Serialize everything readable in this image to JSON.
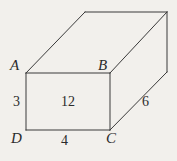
{
  "figure": {
    "type": "rectangular-prism-diagram",
    "background_color": "#f2f0ec",
    "line_color": "#3a3a3a",
    "text_color": "#2b2b2b",
    "vertices": {
      "A": {
        "label": "A",
        "x": 26,
        "y": 73
      },
      "B": {
        "label": "B",
        "x": 110,
        "y": 73
      },
      "C": {
        "label": "C",
        "x": 110,
        "y": 130
      },
      "D": {
        "label": "D",
        "x": 26,
        "y": 130
      },
      "back_top_left": {
        "x": 85,
        "y": 12
      },
      "back_top_right": {
        "x": 167,
        "y": 12
      },
      "back_bottom_right": {
        "x": 167,
        "y": 72
      }
    },
    "dimensions": {
      "height_AD": "3",
      "width_DC": "4",
      "depth_CE": "6",
      "face_area_ABCD": "12"
    },
    "labels": {
      "A": "A",
      "B": "B",
      "C": "C",
      "D": "D",
      "edge_left": "3",
      "edge_bottom": "4",
      "edge_depth": "6",
      "face_value": "12"
    }
  }
}
